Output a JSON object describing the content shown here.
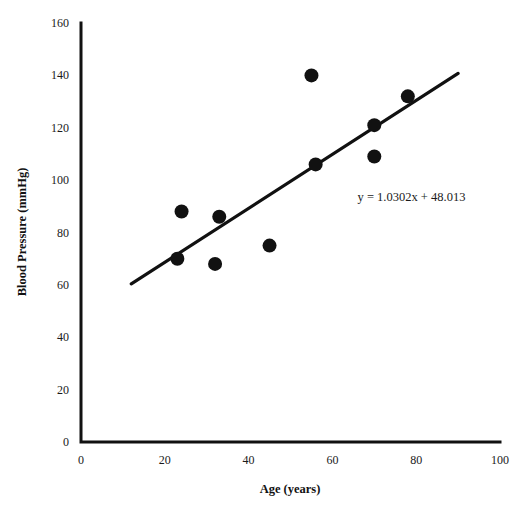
{
  "chart_data": {
    "type": "scatter",
    "title": "",
    "xlabel": "Age (years)",
    "ylabel": "Blood Pressure (mmHg)",
    "xlim": [
      0,
      100
    ],
    "ylim": [
      0,
      160
    ],
    "xticks": [
      0,
      20,
      40,
      60,
      80,
      100
    ],
    "yticks": [
      0,
      20,
      40,
      60,
      80,
      100,
      120,
      140,
      160
    ],
    "xtick_labels": [
      "0",
      "20",
      "40",
      "60",
      "80",
      "100"
    ],
    "ytick_labels": [
      "0",
      "20",
      "40",
      "60",
      "80",
      "100",
      "120",
      "140",
      "160"
    ],
    "grid": false,
    "legend": false,
    "series": [
      {
        "name": "Blood Pressure vs Age",
        "marker": "circle",
        "color": "#111111",
        "points": [
          {
            "x": 23,
            "y": 70
          },
          {
            "x": 24,
            "y": 88
          },
          {
            "x": 32,
            "y": 68
          },
          {
            "x": 33,
            "y": 86
          },
          {
            "x": 45,
            "y": 75
          },
          {
            "x": 55,
            "y": 140
          },
          {
            "x": 56,
            "y": 106
          },
          {
            "x": 70,
            "y": 109
          },
          {
            "x": 70,
            "y": 121
          },
          {
            "x": 78,
            "y": 132
          }
        ]
      }
    ],
    "trendline": {
      "type": "linear",
      "equation": "y = 1.0302x + 48.013",
      "slope": 1.0302,
      "intercept": 48.013,
      "x_start": 12,
      "x_end": 90,
      "color": "#111111"
    },
    "annotations": [
      {
        "name": "regression-equation",
        "text": "y = 1.0302x + 48.013",
        "x": 66,
        "y": 92
      }
    ]
  },
  "axes": {
    "y_title": "Blood Pressure (mmHg)",
    "x_title": "Age (years)"
  }
}
